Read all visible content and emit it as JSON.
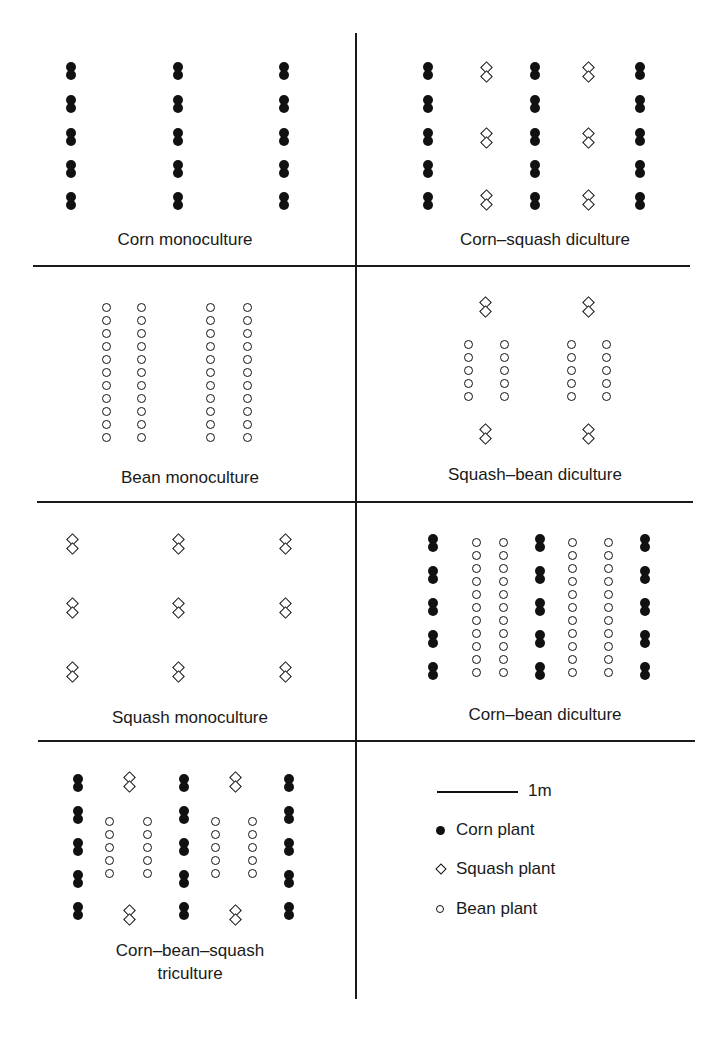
{
  "figure": {
    "panels": [
      {
        "id": "corn-mono",
        "label": "Corn monoculture"
      },
      {
        "id": "corn-squash",
        "label": "Corn–squash diculture"
      },
      {
        "id": "bean-mono",
        "label": "Bean monoculture"
      },
      {
        "id": "squash-bean",
        "label": "Squash–bean diculture"
      },
      {
        "id": "squash-mono",
        "label": "Squash monoculture"
      },
      {
        "id": "corn-bean",
        "label": "Corn–bean diculture"
      },
      {
        "id": "triculture",
        "label_line1": "Corn–bean–squash",
        "label_line2": "triculture"
      }
    ],
    "legend": {
      "scale_label": "1m",
      "items": [
        {
          "symbol": "filled-circle",
          "label": "Corn plant"
        },
        {
          "symbol": "open-diamond",
          "label": "Squash plant"
        },
        {
          "symbol": "open-circle",
          "label": "Bean plant"
        }
      ]
    },
    "plant_layout": {
      "corn-mono": {
        "corn": {
          "cols": [
            71,
            178,
            284
          ],
          "rows": [
            62,
            95,
            128,
            160,
            192
          ]
        }
      },
      "corn-squash": {
        "corn": {
          "cols": [
            428,
            535,
            640
          ],
          "rows": [
            62,
            95,
            128,
            160,
            192
          ]
        },
        "squash": {
          "cols": [
            485,
            587
          ],
          "rows": [
            62,
            128,
            190
          ]
        }
      },
      "bean-mono": {
        "bean": {
          "cols": [
            107,
            142,
            211,
            248
          ],
          "rows_start": 303,
          "count": 11,
          "step": 13
        }
      },
      "squash-bean": {
        "squash": {
          "cols": [
            484,
            587
          ],
          "rows": [
            297,
            424
          ]
        },
        "bean": {
          "cols": [
            469,
            505,
            572,
            607
          ],
          "rows_start": 340,
          "count": 5,
          "step": 13
        }
      },
      "squash-mono": {
        "squash": {
          "cols": [
            71,
            177,
            284
          ],
          "rows": [
            534,
            598,
            662
          ]
        }
      },
      "corn-bean": {
        "corn": {
          "cols": [
            433,
            540,
            645
          ],
          "rows": [
            534,
            566,
            598,
            630,
            662
          ]
        },
        "bean": {
          "cols": [
            477,
            504,
            573,
            609
          ],
          "rows_start": 538,
          "count": 11,
          "step": 13
        }
      },
      "triculture": {
        "corn": {
          "cols": [
            78,
            184,
            289
          ],
          "rows": [
            774,
            806,
            838,
            870,
            902
          ]
        },
        "squash": {
          "cols": [
            128,
            234
          ],
          "rows": [
            772,
            905
          ]
        },
        "bean": {
          "cols": [
            110,
            148,
            216,
            253
          ],
          "rows_start": 817,
          "count": 5,
          "step": 13
        }
      }
    }
  }
}
